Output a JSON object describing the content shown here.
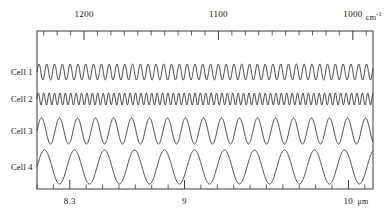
{
  "chart_data": {
    "type": "line",
    "title": "",
    "subtitle": "",
    "xlabel_top": "cm⁻¹",
    "xlabel_bottom": "μm",
    "ylabel": "",
    "grid": false,
    "legend_position": "left",
    "top_axis": {
      "name": "wavenumber",
      "unit": "cm-1",
      "direction": "decreasing",
      "range": [
        1235,
        985
      ],
      "major_ticks": [
        1200,
        1100,
        1000
      ],
      "major_tick_labels": [
        "1200",
        "1100",
        "1000"
      ],
      "minor_tick_step": 10
    },
    "bottom_axis": {
      "name": "wavelength",
      "unit": "um",
      "direction": "increasing",
      "range": [
        8.1,
        10.15
      ],
      "major_ticks": [
        8.3,
        9,
        10
      ],
      "major_tick_labels": [
        "8.3",
        "9",
        "10"
      ],
      "minor_tick_step": 0.1
    },
    "series": [
      {
        "name": "Cell 1",
        "label": "Cell 1",
        "baseline_y": 72,
        "amplitude": 8,
        "period_px": 7.8,
        "phase": 0.0,
        "fringe_count": 43,
        "color": "#2b2b2b"
      },
      {
        "name": "Cell 2",
        "label": "Cell 2",
        "baseline_y": 99,
        "amplitude": 6,
        "period_px": 5.4,
        "phase": 0.0,
        "fringe_count": 62,
        "color": "#2b2b2b"
      },
      {
        "name": "Cell 3",
        "label": "Cell 3",
        "baseline_y": 131,
        "amplitude": 13,
        "period_px": 18.0,
        "phase": 0.0,
        "fringe_count": 19,
        "color": "#2b2b2b"
      },
      {
        "name": "Cell 4",
        "label": "Cell 4",
        "baseline_y": 167,
        "amplitude": 17,
        "period_px": 30.0,
        "phase": 0.0,
        "fringe_count": 11,
        "color": "#2b2b2b"
      }
    ]
  },
  "top_axis_labels": {
    "t1": "1200",
    "t2": "1100",
    "t3": "1000",
    "unit": "cm",
    "unit_sup": "-1"
  },
  "bottom_axis_labels": {
    "b1": "8.3",
    "b2": "9",
    "b3": "10",
    "unit": "μm"
  },
  "cell_labels": {
    "c1": "Cell 1",
    "c2": "Cell 2",
    "c3": "Cell 3",
    "c4": "Cell 4"
  },
  "frame": {
    "left": 37,
    "right": 373,
    "top": 31,
    "bottom": 189,
    "stroke": "#3a3a3a"
  }
}
